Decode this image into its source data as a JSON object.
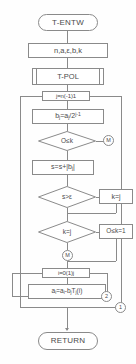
{
  "diagram": {
    "stroke_color": "#8a8a8a",
    "text_color": "#4a4a4a",
    "background": "#ffffff"
  },
  "nodes": {
    "start": {
      "label": "T-ENTW",
      "shape": "terminal"
    },
    "input": {
      "label": "n, a, ε, b, k",
      "shape": "process"
    },
    "subroutine": {
      "label": "T-POL",
      "shape": "predefined-process"
    },
    "loop_outer": {
      "label": "j=n(-1)1",
      "shape": "loop"
    },
    "assign_b": {
      "label": "bⱼ = aⱼ / 2ʲ⁻¹",
      "shape": "process"
    },
    "decision_zero_k": {
      "label": "O≤k",
      "shape": "decision"
    },
    "connector_m": {
      "label": "M",
      "shape": "connector"
    },
    "accumulate_s": {
      "label": "s = s + |bⱼ|",
      "shape": "process"
    },
    "decision_s_eps": {
      "label": "s > ε",
      "shape": "decision"
    },
    "assign_k_j": {
      "label": "k = j",
      "shape": "process"
    },
    "decision_k_j": {
      "label": "k = j",
      "shape": "decision"
    },
    "assign_zero_k": {
      "label": "O≤k = 1",
      "shape": "process"
    },
    "connector_m2": {
      "label": "M",
      "shape": "connector"
    },
    "loop_inner": {
      "label": "i=0(1)j",
      "shape": "loop"
    },
    "assign_a": {
      "label": "aᵢ = aᵢ - bⱼ Tⱼ(i)",
      "shape": "process"
    },
    "connector_2": {
      "label": "2",
      "shape": "connector"
    },
    "connector_1": {
      "label": "1",
      "shape": "connector"
    },
    "return": {
      "label": "RETURN",
      "shape": "terminal"
    }
  },
  "node_text": {
    "start": "T-ENTW",
    "input": "n,a,ε,b,k",
    "subroutine": "T-POL",
    "loop_outer": "j=n(-1)1",
    "assign_b_lhs": "b",
    "assign_b_lhs_sub": "j",
    "assign_b_eq": "=a",
    "assign_b_rhs_sub": "j",
    "assign_b_div": "/2",
    "assign_b_exp": "j-1",
    "decision_zero_k": "O≤k",
    "connector_m": "M",
    "accumulate_s": "s=s+|b",
    "accumulate_s_sub": "j",
    "accumulate_s_end": "|",
    "decision_s_eps": "s>ε",
    "assign_k_j": "k=j",
    "decision_k_j": "k=j",
    "assign_zero_k": "O≤k=1",
    "connector_m2": "M",
    "loop_inner": "i=0(1)j",
    "assign_a_a1": "a",
    "assign_a_sub1": "i",
    "assign_a_eq": "=a",
    "assign_a_sub2": "i",
    "assign_a_minus": "-b",
    "assign_a_sub3": "j",
    "assign_a_T": "T",
    "assign_a_sub4": "j",
    "assign_a_arg": "(i)",
    "connector_2": "2",
    "connector_1": "1",
    "return": "RETURN"
  }
}
